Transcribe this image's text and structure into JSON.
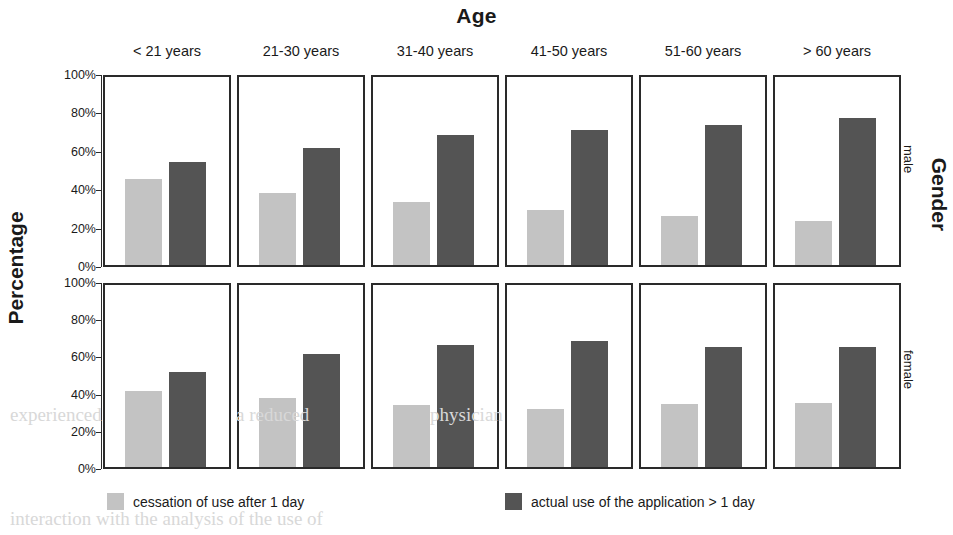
{
  "figure": {
    "top_title": "Age",
    "left_title": "Percentage",
    "right_title": "Gender"
  },
  "legend": {
    "items": [
      {
        "label": "cessation of use after 1 day",
        "color": "#c3c3c3",
        "swatch_name": "legend-swatch-light"
      },
      {
        "label": "actual use of the application > 1 day",
        "color": "#545454",
        "swatch_name": "legend-swatch-dark"
      }
    ]
  },
  "yaxis": {
    "ticks": [
      "100%",
      "80%",
      "60%",
      "40%",
      "20%",
      "0%"
    ],
    "values": [
      100,
      80,
      60,
      40,
      20,
      0
    ]
  },
  "chart_data": {
    "type": "bar",
    "title": "",
    "subtitle": "",
    "xlabel": "Age",
    "ylabel": "Percentage",
    "ylim": [
      0,
      100
    ],
    "yticks": [
      0,
      20,
      40,
      60,
      80,
      100
    ],
    "ytick_labels": [
      "0%",
      "20%",
      "40%",
      "60%",
      "80%",
      "100%"
    ],
    "grid": false,
    "legend_position": "bottom",
    "facet_cols_label": "Age",
    "facet_rows_label": "Gender",
    "categories": [
      "< 21 years",
      "21-30 years",
      "31-40 years",
      "41-50 years",
      "51-60 years",
      "> 60 years"
    ],
    "row_categories": [
      "male",
      "female"
    ],
    "series": [
      {
        "name": "cessation of use after 1 day",
        "color": "#c3c3c3"
      },
      {
        "name": "actual use of the application > 1 day",
        "color": "#545454"
      }
    ],
    "panels": [
      {
        "row": "male",
        "col": "< 21 years",
        "values": [
          46,
          55
        ]
      },
      {
        "row": "male",
        "col": "21-30 years",
        "values": [
          38.5,
          62.5
        ]
      },
      {
        "row": "male",
        "col": "31-40 years",
        "values": [
          33.5,
          69
        ]
      },
      {
        "row": "male",
        "col": "41-50 years",
        "values": [
          29,
          72
        ]
      },
      {
        "row": "male",
        "col": "51-60 years",
        "values": [
          26,
          74.5
        ]
      },
      {
        "row": "male",
        "col": "> 60 years",
        "values": [
          23.5,
          78
        ]
      },
      {
        "row": "female",
        "col": "< 21 years",
        "values": [
          42,
          52
        ]
      },
      {
        "row": "female",
        "col": "21-30 years",
        "values": [
          38,
          62
        ]
      },
      {
        "row": "female",
        "col": "31-40 years",
        "values": [
          34,
          67
        ]
      },
      {
        "row": "female",
        "col": "41-50 years",
        "values": [
          32,
          69
        ]
      },
      {
        "row": "female",
        "col": "51-60 years",
        "values": [
          34.5,
          66
        ]
      },
      {
        "row": "female",
        "col": "> 60 years",
        "values": [
          35,
          66
        ]
      }
    ]
  },
  "ghosts": [
    {
      "text": "experienced",
      "x": 10,
      "y": 404
    },
    {
      "text": "a reduced",
      "x": 236,
      "y": 404
    },
    {
      "text": "physician",
      "x": 430,
      "y": 404
    },
    {
      "text": "interaction with the analysis of the use of",
      "x": 10,
      "y": 508
    }
  ]
}
